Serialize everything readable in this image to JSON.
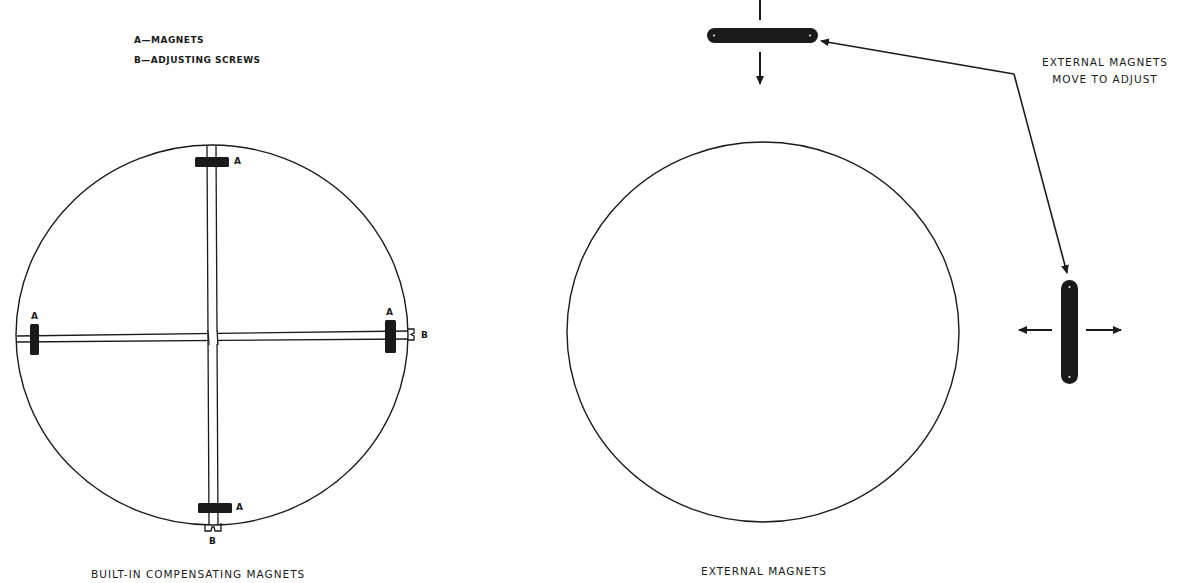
{
  "legend": {
    "items": [
      {
        "key": "A",
        "text": "A—MAGNETS"
      },
      {
        "key": "B",
        "text": "B—ADJUSTING  SCREWS"
      }
    ]
  },
  "left_figure": {
    "caption": "BUILT-IN  COMPENSATING  MAGNETS",
    "magnet_letter": "A",
    "screw_letter": "B",
    "magnet_count": 4,
    "screw_count": 2
  },
  "right_figure": {
    "caption": "EXTERNAL  MAGNETS",
    "note_line1": "EXTERNAL   MAGNETS",
    "note_line2": "MOVE  TO   ADJUST",
    "magnet_count": 2
  },
  "colors": {
    "ink": "#1a1a1a",
    "background": "#ffffff"
  }
}
